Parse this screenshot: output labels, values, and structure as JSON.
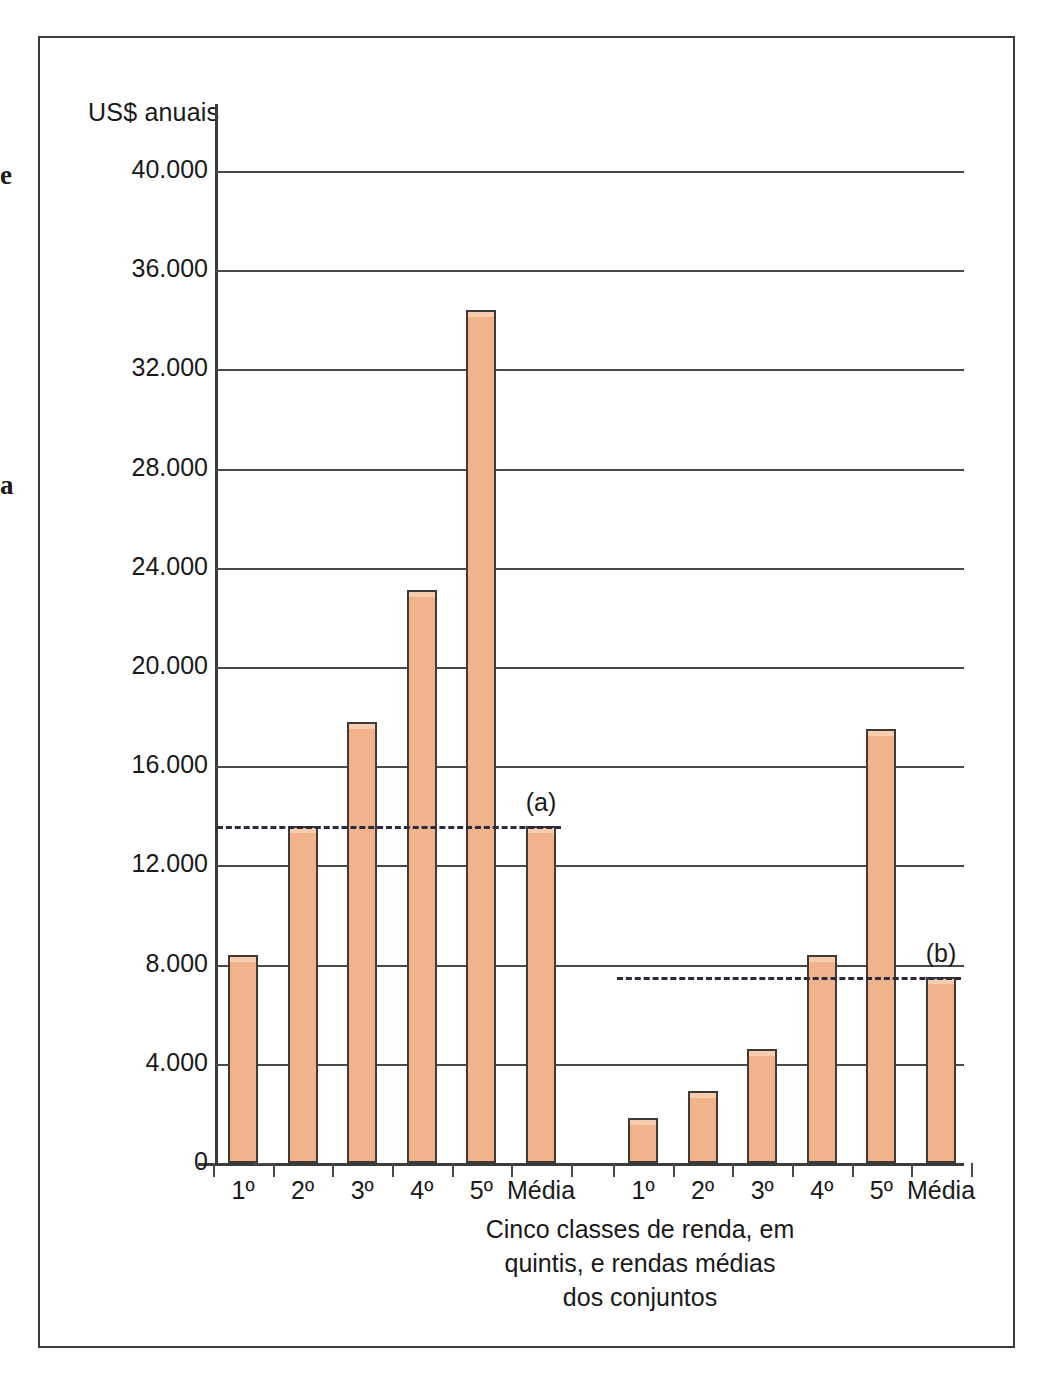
{
  "figure": {
    "y_axis_title": "US$ anuais",
    "caption_lines": [
      "Cinco classes de renda, em",
      "quintis, e rendas médias",
      "dos conjuntos"
    ],
    "annotation_a": "(a)",
    "annotation_b": "(b)",
    "bar_color": "#f0b38c",
    "bar_edge_color": "#3f3a36",
    "grid_color": "#4a4a4a",
    "frame_color": "#3b3b3b",
    "dashed_line_color": "#2b2b3a"
  },
  "margin_glyphs": [
    {
      "text": "e",
      "top": 160
    },
    {
      "text": "a",
      "top": 470
    }
  ],
  "chart_data": {
    "type": "bar",
    "title": "",
    "subtitle": "",
    "xlabel": "Cinco classes de renda, em quintis, e rendas médias dos conjuntos",
    "ylabel": "US$ anuais",
    "ylim": [
      0,
      40000
    ],
    "yticks": [
      0,
      4000,
      8000,
      12000,
      16000,
      20000,
      24000,
      28000,
      32000,
      36000,
      40000
    ],
    "ytick_labels": [
      "0",
      "4.000",
      "8.000",
      "12.000",
      "16.000",
      "20.000",
      "24.000",
      "28.000",
      "32.000",
      "36.000",
      "40.000"
    ],
    "grid": true,
    "legend": "none",
    "categories": [
      "1º",
      "2º",
      "3º",
      "4º",
      "5º",
      "Média"
    ],
    "groups": [
      {
        "name": "(a)",
        "label": "(a)",
        "values": [
          8400,
          13600,
          17800,
          23100,
          34400,
          13600
        ],
        "mean_line": 13600
      },
      {
        "name": "(b)",
        "label": "(b)",
        "values": [
          1800,
          2900,
          4600,
          8400,
          17500,
          7500
        ],
        "mean_line": 7500
      }
    ]
  }
}
